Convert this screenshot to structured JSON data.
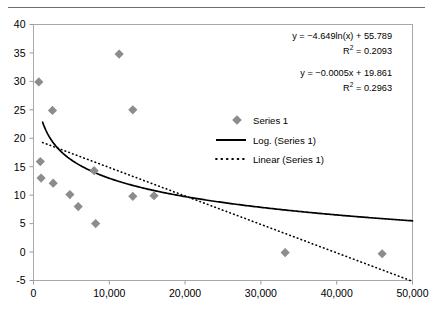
{
  "chart_data": {
    "type": "scatter",
    "title": "",
    "xlabel": "",
    "ylabel": "",
    "xlim": [
      0,
      50000
    ],
    "ylim": [
      -5,
      40
    ],
    "xticks": [
      0,
      10000,
      20000,
      30000,
      40000,
      50000
    ],
    "xticklabels": [
      "0",
      "10,000",
      "20,000",
      "30,000",
      "40,000",
      "50,000"
    ],
    "yticks": [
      -5,
      0,
      5,
      10,
      15,
      20,
      25,
      30,
      35,
      40
    ],
    "yticklabels": [
      "-5",
      "0",
      "5",
      "10",
      "15",
      "20",
      "25",
      "30",
      "35",
      "40"
    ],
    "grid": false,
    "legend_position": "upper right inside",
    "series": [
      {
        "name": "Series 1",
        "type": "scatter",
        "marker": "diamond",
        "color": "#8c8c8c",
        "points": [
          {
            "x": 700,
            "y": 29.9
          },
          {
            "x": 11300,
            "y": 34.8
          },
          {
            "x": 2500,
            "y": 24.9
          },
          {
            "x": 13100,
            "y": 25.0
          },
          {
            "x": 900,
            "y": 15.9
          },
          {
            "x": 1000,
            "y": 13.0
          },
          {
            "x": 2600,
            "y": 12.1
          },
          {
            "x": 8000,
            "y": 14.3
          },
          {
            "x": 4800,
            "y": 10.1
          },
          {
            "x": 5900,
            "y": 8.0
          },
          {
            "x": 13100,
            "y": 9.8
          },
          {
            "x": 15900,
            "y": 9.9
          },
          {
            "x": 8200,
            "y": 5.0
          },
          {
            "x": 33200,
            "y": -0.1
          },
          {
            "x": 46000,
            "y": -0.3
          }
        ]
      },
      {
        "name": "Log. (Series 1)",
        "type": "trendline",
        "style": "solid",
        "color": "#000000",
        "equation": "y = -4.649ln(x) + 55.789",
        "r_squared": 0.2093,
        "coefficients": {
          "a": -4.649,
          "b": 55.789
        }
      },
      {
        "name": "Linear (Series 1)",
        "type": "trendline",
        "style": "dotted",
        "color": "#000000",
        "equation": "y = -0.0005x + 19.861",
        "r_squared": 0.2963,
        "coefficients": {
          "slope": -0.0005,
          "intercept": 19.861
        }
      }
    ],
    "annotations": [
      {
        "id": "log-equation",
        "lines": [
          "y = −4.649ln(x) + 55.789",
          "R² = 0.2093"
        ],
        "equation_line": "y = −4.649ln(x) + 55.789",
        "r2_prefix": "R",
        "r2_sup": "2",
        "r2_value": " = 0.2093"
      },
      {
        "id": "linear-equation",
        "lines": [
          "y = −0.0005x + 19.861",
          "R² = 0.2963"
        ],
        "equation_line": "y = −0.0005x + 19.861",
        "r2_prefix": "R",
        "r2_sup": "2",
        "r2_value": " = 0.2963"
      }
    ],
    "legend_entries": [
      {
        "label": "Series 1",
        "glyph": "diamond-marker",
        "color": "#8c8c8c"
      },
      {
        "label": "Log. (Series 1)",
        "glyph": "solid-line",
        "color": "#000000"
      },
      {
        "label": "Linear (Series 1)",
        "glyph": "dotted-line",
        "color": "#000000"
      }
    ]
  },
  "colors": {
    "marker": "#8c8c8c",
    "axis": "#9a9a9a",
    "plot_border": "#a8a8a8",
    "trend": "#000000",
    "rule": "#6e6e6e",
    "background": "#ffffff"
  }
}
